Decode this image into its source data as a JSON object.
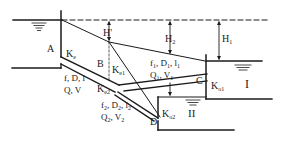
{
  "diagram": {
    "type": "branching-pipe-hydraulics",
    "points": {
      "A": "A",
      "B": "B",
      "C": "C",
      "D": "D"
    },
    "reservoirs": {
      "I": "I",
      "II": "II"
    },
    "heads": {
      "H_prime": "H'",
      "H2": "H",
      "H2_sub": "2",
      "H1": "H",
      "H1_sub": "1"
    },
    "loss_coefficients": {
      "Ke": "K",
      "Ke_sub": "e",
      "Ke1": "K",
      "Ke1_sub": "e1",
      "Ke2": "K",
      "Ke2_sub": "e2",
      "Ko1": "K",
      "Ko1_sub": "o1",
      "Ko2": "K",
      "Ko2_sub": "o2"
    },
    "main_pipe": {
      "line1": "f, D, l",
      "line2": "Q, V"
    },
    "pipe1": {
      "line1_parts": [
        "f",
        "1",
        ", D",
        "1",
        ", l",
        "1"
      ],
      "line2_parts": [
        "Q",
        "1",
        ", V",
        "1"
      ]
    },
    "pipe2": {
      "line1_parts": [
        "f",
        "2",
        ", D",
        "2",
        ", l",
        "2"
      ],
      "line2_parts": [
        "Q",
        "2",
        ", V",
        "2"
      ]
    },
    "colors": {
      "ink": "#1a1a1a",
      "background": "#ffffff"
    }
  }
}
